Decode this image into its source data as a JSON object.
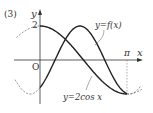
{
  "figure": {
    "problem_number": "(3)",
    "axis_x_label": "x",
    "axis_y_label": "y",
    "origin_label": "O",
    "y_tick_label": "2",
    "x_tick_label": "π",
    "curve_f_label": "y=f(x)",
    "curve_cos_label": "y=2cos x",
    "colors": {
      "curve": "#222222",
      "axis": "#333333",
      "dashed": "#555555"
    }
  },
  "chart_data": {
    "type": "line",
    "title": "(3)",
    "xlabel": "x",
    "ylabel": "y",
    "x_ticks": [
      "0",
      "π"
    ],
    "y_ticks": [
      "2"
    ],
    "xlim": [
      -0.3,
      3.5
    ],
    "ylim": [
      -2.4,
      2.6
    ],
    "series": [
      {
        "name": "y=2cos x",
        "style": "solid on [0, π], dashed outside",
        "x": [
          0,
          0.5236,
          1.0472,
          1.5708,
          2.0944,
          2.618,
          3.1416
        ],
        "y": [
          2,
          1.73,
          1,
          0,
          -1,
          -1.73,
          -2
        ]
      },
      {
        "name": "y=f(x)",
        "style": "solid on [0, π], dashed outside",
        "x": [
          0,
          0.5236,
          1.0472,
          1.3,
          1.5708,
          2.0944,
          2.618,
          3.1416
        ],
        "y": [
          -1.6,
          -0.1,
          1.5,
          1.95,
          1.8,
          0.3,
          -1.4,
          -2
        ]
      }
    ],
    "annotations": [
      "curves meet at (π, -2)",
      "dashed vertical line at x=π"
    ]
  }
}
